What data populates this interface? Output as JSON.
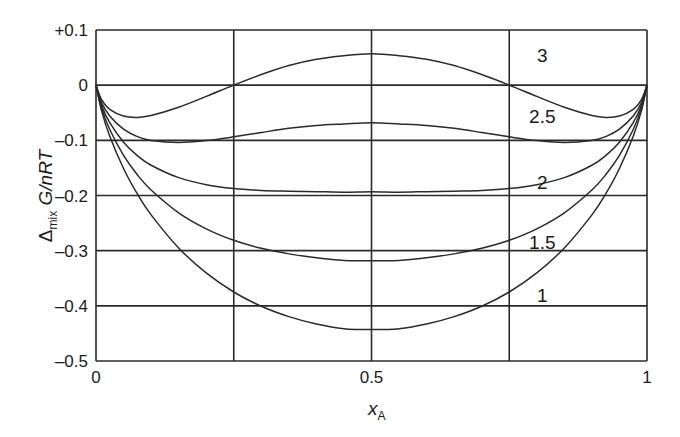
{
  "chart_data": {
    "type": "line",
    "title": "",
    "xlabel": "x_A",
    "xlabel_main": "x",
    "xlabel_sub": "A",
    "ylabel": "Δmix G/nRT",
    "ylabel_delta": "Δ",
    "ylabel_sub": "mix",
    "ylabel_rest": " G/nRT",
    "xlim": [
      0,
      1
    ],
    "ylim": [
      -0.5,
      0.1
    ],
    "grid": true,
    "x_ticks": [
      0,
      0.5,
      1
    ],
    "x_tick_labels": [
      "0",
      "0.5",
      "1"
    ],
    "x_gridlines": [
      0,
      0.25,
      0.5,
      0.75,
      1
    ],
    "y_ticks": [
      0.1,
      0,
      -0.1,
      -0.2,
      -0.3,
      -0.4,
      -0.5
    ],
    "y_tick_labels": [
      "+0.1",
      "0",
      "–0.1",
      "–0.2",
      "–0.3",
      "–0.4",
      "–0.5"
    ],
    "model": "x ln x + (1−x) ln(1−x) + ξ x(1−x)",
    "x": [
      0.0,
      0.01,
      0.025,
      0.05,
      0.075,
      0.1,
      0.15,
      0.2,
      0.25,
      0.3,
      0.35,
      0.4,
      0.45,
      0.5,
      0.55,
      0.6,
      0.65,
      0.7,
      0.75,
      0.8,
      0.85,
      0.9,
      0.925,
      0.95,
      0.975,
      0.99,
      1.0
    ],
    "series": [
      {
        "name": "3",
        "xi": 3,
        "label_pos": [
          0.81,
          0.055
        ],
        "values": [
          0,
          -0.0263,
          -0.0437,
          -0.056,
          -0.0585,
          -0.0551,
          -0.0401,
          -0.0204,
          0.0001,
          0.0192,
          0.0355,
          0.047,
          0.0535,
          0.0569,
          0.0535,
          0.047,
          0.0355,
          0.0192,
          0.0001,
          -0.0204,
          -0.0401,
          -0.0551,
          -0.0585,
          -0.056,
          -0.0437,
          -0.0263,
          0
        ]
      },
      {
        "name": "2.5",
        "xi": 2.5,
        "label_pos": [
          0.81,
          -0.055
        ],
        "values": [
          0,
          -0.0313,
          -0.0559,
          -0.0797,
          -0.0932,
          -0.1001,
          -0.1039,
          -0.1004,
          -0.0937,
          -0.0858,
          -0.0783,
          -0.073,
          -0.0703,
          -0.0681,
          -0.0703,
          -0.073,
          -0.0783,
          -0.0858,
          -0.0937,
          -0.1004,
          -0.1039,
          -0.1001,
          -0.0932,
          -0.0797,
          -0.0559,
          -0.0313,
          0
        ]
      },
      {
        "name": "2",
        "xi": 2,
        "label_pos": [
          0.81,
          -0.175
        ],
        "values": [
          0,
          -0.0362,
          -0.0681,
          -0.1035,
          -0.1278,
          -0.1451,
          -0.1676,
          -0.1804,
          -0.1874,
          -0.1908,
          -0.1921,
          -0.193,
          -0.194,
          -0.1931,
          -0.194,
          -0.193,
          -0.1921,
          -0.1908,
          -0.1874,
          -0.1804,
          -0.1676,
          -0.1451,
          -0.1278,
          -0.1035,
          -0.0681,
          -0.0362,
          0
        ]
      },
      {
        "name": "1.5",
        "xi": 1.5,
        "label_pos": [
          0.81,
          -0.285
        ],
        "values": [
          0,
          -0.0412,
          -0.0803,
          -0.1272,
          -0.1625,
          -0.1901,
          -0.2314,
          -0.2604,
          -0.2812,
          -0.2958,
          -0.3058,
          -0.313,
          -0.3178,
          -0.3181,
          -0.3178,
          -0.313,
          -0.3058,
          -0.2958,
          -0.2812,
          -0.2604,
          -0.2314,
          -0.1901,
          -0.1625,
          -0.1272,
          -0.0803,
          -0.0412,
          0
        ]
      },
      {
        "name": "1",
        "xi": 1,
        "label_pos": [
          0.81,
          -0.38
        ],
        "values": [
          0,
          -0.0461,
          -0.0925,
          -0.151,
          -0.1972,
          -0.2351,
          -0.2951,
          -0.3404,
          -0.3749,
          -0.4008,
          -0.4196,
          -0.433,
          -0.4415,
          -0.4431,
          -0.4415,
          -0.433,
          -0.4196,
          -0.4008,
          -0.3749,
          -0.3404,
          -0.2951,
          -0.2351,
          -0.1972,
          -0.151,
          -0.0925,
          -0.0461,
          0
        ]
      }
    ]
  },
  "layout": {
    "plot": {
      "left": 96,
      "right": 647,
      "top": 30,
      "bottom": 361
    }
  },
  "colors": {
    "line": "#2a2a2a",
    "background": "#ffffff",
    "text": "#1a1a1a"
  }
}
